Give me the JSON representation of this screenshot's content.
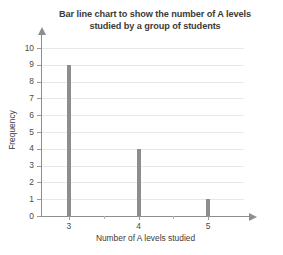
{
  "chart_data": {
    "type": "bar",
    "title": "Bar line chart to show the number of A levels studied by a group of students",
    "title_lines": [
      "Bar line chart to show the number of A levels",
      "studied by a group of students"
    ],
    "xlabel": "Number of A levels studied",
    "ylabel": "Frequency",
    "categories": [
      3,
      4,
      5
    ],
    "values": [
      9,
      4,
      1
    ],
    "x_tick_labels": [
      "3",
      "4",
      "5"
    ],
    "y_tick_labels": [
      "0",
      "1",
      "2",
      "3",
      "4",
      "5",
      "6",
      "7",
      "8",
      "9",
      "10"
    ],
    "xlim": [
      2.6,
      5.6
    ],
    "ylim": [
      0,
      10
    ],
    "y_tick_step": 1,
    "x_minor_ticks": [
      3.5,
      4.5
    ],
    "grid": true,
    "legend": "none",
    "colors": {
      "bar": "#8d8d8d",
      "axis": "#8e8e8e",
      "grid": "#e8e8e8",
      "text": "#3b3b3b",
      "tick_text": "#4a4a4a",
      "background": "#ffffff"
    }
  }
}
